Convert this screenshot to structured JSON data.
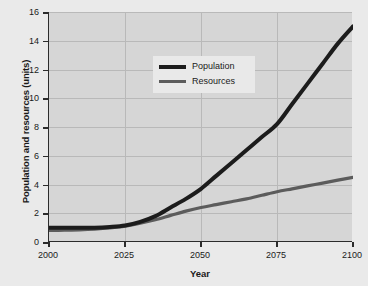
{
  "chart_data": {
    "type": "line",
    "title": "",
    "xlabel": "Year",
    "ylabel": "Population and resources (units)",
    "xlim": [
      2000,
      2100
    ],
    "ylim": [
      0,
      16
    ],
    "grid": true,
    "legend_position": "upper-left-inside",
    "x_ticks": [
      "2000",
      "2025",
      "2050",
      "2075",
      "2100"
    ],
    "y_ticks": [
      "0",
      "2",
      "4",
      "6",
      "8",
      "10",
      "12",
      "14",
      "16"
    ],
    "x": [
      2000,
      2005,
      2010,
      2015,
      2020,
      2025,
      2030,
      2035,
      2040,
      2045,
      2050,
      2055,
      2060,
      2065,
      2070,
      2075,
      2080,
      2085,
      2090,
      2095,
      2100
    ],
    "series": [
      {
        "name": "Population",
        "color": "#1c1c1c",
        "values": [
          1.0,
          1.0,
          1.0,
          1.0,
          1.05,
          1.15,
          1.4,
          1.8,
          2.4,
          3.0,
          3.7,
          4.6,
          5.5,
          6.4,
          7.3,
          8.2,
          9.6,
          11.0,
          12.4,
          13.8,
          15.0
        ]
      },
      {
        "name": "Resources",
        "color": "#5c5c5c",
        "values": [
          0.8,
          0.82,
          0.85,
          0.9,
          0.98,
          1.1,
          1.3,
          1.55,
          1.85,
          2.15,
          2.4,
          2.6,
          2.8,
          3.0,
          3.25,
          3.5,
          3.7,
          3.9,
          4.1,
          4.3,
          4.5
        ]
      }
    ]
  },
  "legend": {
    "items": [
      {
        "label": "Population"
      },
      {
        "label": "Resources"
      }
    ]
  },
  "colors": {
    "page_background": "#eaeaea",
    "plot_background": "#d6d6d6",
    "axis": "#2b2b2b",
    "gridline": "#b9b9b9",
    "population": "#1c1c1c",
    "resources": "#5c5c5c"
  }
}
